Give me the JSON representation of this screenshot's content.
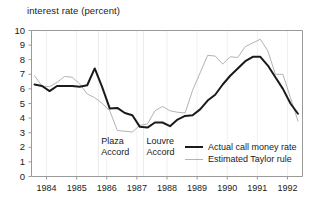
{
  "chart_data": {
    "type": "line",
    "title": "interest rate (percent)",
    "xlabel": "",
    "ylabel": "interest rate (percent)",
    "ylim": [
      0,
      10
    ],
    "xlim": [
      1983.5,
      1992.5
    ],
    "ytick_labels": [
      "10",
      "9",
      "8",
      "7",
      "6",
      "5",
      "4",
      "3",
      "2",
      "1",
      "0"
    ],
    "ytick_values": [
      10,
      9,
      8,
      7,
      6,
      5,
      4,
      3,
      2,
      1,
      0
    ],
    "xtick_labels": [
      "1984",
      "1985",
      "1986",
      "1987",
      "1988",
      "1989",
      "1990",
      "1991",
      "1992"
    ],
    "xtick_values": [
      1984,
      1985,
      1986,
      1987,
      1988,
      1989,
      1990,
      1991,
      1992
    ],
    "grid": "vertical-faint",
    "legend_position": "inside-bottom-right",
    "series": [
      {
        "name": "Actual call money rate",
        "color": "#1a1a1a",
        "width": 2,
        "x": [
          1983.6,
          1983.85,
          1984.1,
          1984.35,
          1984.6,
          1984.85,
          1985.1,
          1985.35,
          1985.6,
          1985.85,
          1986.1,
          1986.35,
          1986.6,
          1986.85,
          1987.1,
          1987.35,
          1987.6,
          1987.85,
          1988.1,
          1988.35,
          1988.6,
          1988.85,
          1989.1,
          1989.35,
          1989.6,
          1989.85,
          1990.1,
          1990.35,
          1990.6,
          1990.85,
          1991.1,
          1991.35,
          1991.6,
          1991.85,
          1992.1,
          1992.35
        ],
        "values": [
          6.3,
          6.2,
          5.85,
          6.2,
          6.2,
          6.2,
          6.15,
          6.25,
          7.4,
          6.1,
          4.65,
          4.7,
          4.35,
          4.2,
          3.4,
          3.35,
          3.7,
          3.7,
          3.45,
          3.9,
          4.15,
          4.2,
          4.6,
          5.2,
          5.6,
          6.3,
          6.9,
          7.4,
          7.9,
          8.2,
          8.2,
          7.6,
          6.8,
          6.0,
          5.0,
          4.3
        ]
      },
      {
        "name": "Estimated Taylor rule",
        "color": "#b3b3b3",
        "width": 1,
        "x": [
          1983.6,
          1983.85,
          1984.1,
          1984.35,
          1984.6,
          1984.85,
          1985.1,
          1985.35,
          1985.6,
          1985.85,
          1986.1,
          1986.35,
          1986.6,
          1986.85,
          1987.1,
          1987.35,
          1987.6,
          1987.85,
          1988.1,
          1988.35,
          1988.6,
          1988.85,
          1989.1,
          1989.35,
          1989.6,
          1989.85,
          1990.1,
          1990.35,
          1990.6,
          1990.85,
          1991.1,
          1991.35,
          1991.6,
          1991.85,
          1992.1,
          1992.35
        ],
        "values": [
          6.9,
          6.2,
          6.15,
          6.45,
          6.85,
          6.8,
          6.35,
          5.65,
          5.4,
          5.0,
          4.5,
          3.15,
          3.1,
          3.05,
          3.5,
          3.6,
          4.5,
          4.8,
          4.5,
          4.4,
          4.35,
          5.9,
          7.1,
          8.3,
          8.25,
          7.7,
          8.2,
          8.15,
          8.9,
          9.15,
          9.4,
          8.6,
          7.0,
          7.0,
          5.4,
          3.8
        ]
      }
    ],
    "annotations": [
      {
        "id": "plaza",
        "text_line1": "Plaza",
        "text_line2": "Accord",
        "x_value": 1985.72
      },
      {
        "id": "louvre",
        "text_line1": "Louvre",
        "text_line2": "Accord",
        "x_value": 1987.22
      }
    ]
  },
  "legend": {
    "items": [
      {
        "label": "Actual call money rate",
        "swatch": "dark-thick-line"
      },
      {
        "label": "Estimated Taylor rule",
        "swatch": "gray-thin-line"
      }
    ]
  },
  "colors": {
    "actual": "#1a1a1a",
    "taylor": "#b3b3b3",
    "axis": "#9a9a9a",
    "gridline": "#f0f0f0",
    "text": "#1a1a1a",
    "background": "#ffffff"
  }
}
